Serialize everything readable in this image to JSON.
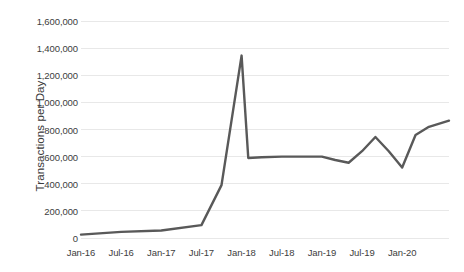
{
  "chart_data": {
    "type": "line",
    "title": "",
    "xlabel": "",
    "ylabel": "Transactions per Day",
    "ylim": [
      0,
      1600000
    ],
    "grid": true,
    "legend": false,
    "line_color": "#595959",
    "gridline_color": "#e8e8e8",
    "y_ticks": [
      0,
      200000,
      400000,
      600000,
      800000,
      1000000,
      1200000,
      1400000,
      1600000
    ],
    "y_tick_labels": [
      "0",
      "200,000",
      "400,000",
      "600,000",
      "800,000",
      "1,000,000",
      "1,200,000",
      "1,400,000",
      "1,600,000"
    ],
    "x_tick_labels": [
      "Jan-16",
      "Jul-16",
      "Jan-17",
      "Jul-17",
      "Jan-18",
      "Jul-18",
      "Jan-19",
      "Jul-19",
      "Jan-20"
    ],
    "x_tick_months": [
      0,
      6,
      12,
      18,
      24,
      30,
      36,
      42,
      48
    ],
    "x_range_months": [
      0,
      55
    ],
    "series": [
      {
        "name": "Transactions per Day",
        "x_months": [
          0,
          6,
          12,
          18,
          21,
          24,
          25,
          27,
          30,
          33,
          36,
          38,
          40,
          42,
          44,
          46,
          48,
          50,
          52,
          55
        ],
        "values": [
          25000,
          45000,
          55000,
          95000,
          390000,
          1345000,
          590000,
          595000,
          600000,
          600000,
          600000,
          575000,
          555000,
          640000,
          745000,
          640000,
          520000,
          760000,
          820000,
          865000
        ]
      }
    ]
  }
}
